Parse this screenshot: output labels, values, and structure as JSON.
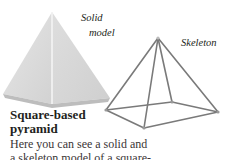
{
  "labels": {
    "solid_line1": "Solid",
    "solid_line2": "model",
    "skeleton": "Skeleton"
  },
  "heading": {
    "line1": "Square-based",
    "line2": "pyramid"
  },
  "body": {
    "line1": "Here you can see a solid and",
    "line2": "a skeleton model of a square-"
  },
  "colors": {
    "solid_light": "#e8e8e8",
    "solid_mid": "#d6d6d6",
    "solid_dark": "#c8c8c8",
    "skeleton_rod": "#7a7a7a",
    "text": "#231f20"
  }
}
